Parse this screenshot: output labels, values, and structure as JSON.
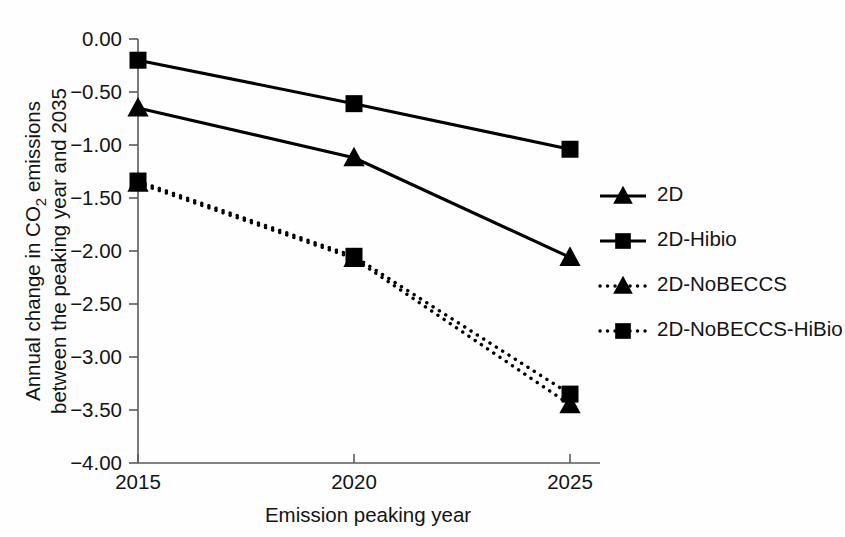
{
  "chart_data": {
    "type": "line",
    "title": "",
    "xlabel": "Emission peaking year",
    "ylabel_line1": "Annual change in CO2 emissions",
    "ylabel_line2": "between the peaking year and 2035",
    "ylabel_prefix": "Annual change in CO",
    "ylabel_sub": "2",
    "ylabel_suffix": " emissions",
    "categories": [
      "2015",
      "2020",
      "2025"
    ],
    "x": [
      2015,
      2020,
      2025
    ],
    "xtick_labels": [
      "2015",
      "2020",
      "2025"
    ],
    "ytick_labels": [
      "0.00",
      "−0.50",
      "−1.00",
      "−1.50",
      "−2.00",
      "−2.50",
      "−3.00",
      "−3.50",
      "−4.00"
    ],
    "ytick_values": [
      0.0,
      -0.5,
      -1.0,
      -1.5,
      -2.0,
      -2.5,
      -3.0,
      -3.5,
      -4.0
    ],
    "ylim": [
      -4.0,
      0.0
    ],
    "xlim": [
      2015,
      2025
    ],
    "grid": false,
    "legend_position": "right",
    "series": [
      {
        "name": "2D",
        "marker": "triangle",
        "line_style": "solid",
        "color": "#000000",
        "values": [
          -0.65,
          -1.12,
          -2.06
        ]
      },
      {
        "name": "2D-Hibio",
        "marker": "square",
        "line_style": "solid",
        "color": "#000000",
        "values": [
          -0.2,
          -0.61,
          -1.04
        ]
      },
      {
        "name": "2D-NoBECCS",
        "marker": "triangle",
        "line_style": "dotted",
        "color": "#000000",
        "values": [
          -1.36,
          -2.07,
          -3.45
        ]
      },
      {
        "name": "2D-NoBECCS-HiBio",
        "marker": "square",
        "line_style": "dotted",
        "color": "#000000",
        "values": [
          -1.34,
          -2.05,
          -3.35
        ]
      }
    ]
  },
  "legend": {
    "entries": [
      {
        "label": "2D",
        "marker": "triangle",
        "line_style": "solid"
      },
      {
        "label": "2D-Hibio",
        "marker": "square",
        "line_style": "solid"
      },
      {
        "label": "2D-NoBECCS",
        "marker": "triangle",
        "line_style": "dotted"
      },
      {
        "label": "2D-NoBECCS-HiBio",
        "marker": "square",
        "line_style": "dotted"
      }
    ]
  },
  "colors": {
    "background": "#fefefe",
    "ink": "#000000",
    "axis": "#5a5a5a",
    "text": "#141414"
  }
}
